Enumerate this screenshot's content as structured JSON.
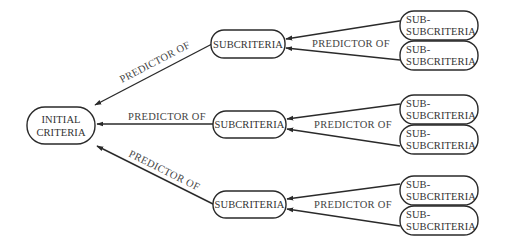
{
  "diagram": {
    "root": {
      "label_line1": "INITIAL",
      "label_line2": "CRITERIA"
    },
    "edge_label": "PREDICTOR OF",
    "branches": [
      {
        "subcriteria": {
          "label": "SUBCRITERIA"
        },
        "edge_to_root_label": "PREDICTOR OF",
        "edge_from_children_label": "PREDICTOR OF",
        "children": [
          {
            "label_line1": "SUB-",
            "label_line2": "SUBCRITERIA"
          },
          {
            "label_line1": "SUB-",
            "label_line2": "SUBCRITERIA"
          }
        ]
      },
      {
        "subcriteria": {
          "label": "SUBCRITERIA"
        },
        "edge_to_root_label": "PREDICTOR OF",
        "edge_from_children_label": "PREDICTOR OF",
        "children": [
          {
            "label_line1": "SUB-",
            "label_line2": "SUBCRITERIA"
          },
          {
            "label_line1": "SUB-",
            "label_line2": "SUBCRITERIA"
          }
        ]
      },
      {
        "subcriteria": {
          "label": "SUBCRITERIA"
        },
        "edge_to_root_label": "PREDICTOR OF",
        "edge_from_children_label": "PREDICTOR OF",
        "children": [
          {
            "label_line1": "SUB-",
            "label_line2": "SUBCRITERIA"
          },
          {
            "label_line1": "SUB-",
            "label_line2": "SUBCRITERIA"
          }
        ]
      }
    ],
    "colors": {
      "stroke": "#2a2a2a",
      "text": "#333333",
      "background": "#ffffff"
    }
  }
}
